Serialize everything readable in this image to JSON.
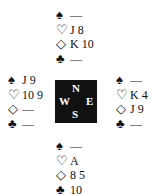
{
  "icons": {
    "spade": "♠",
    "heart": "♡",
    "diamond": "◇",
    "club": "♣"
  },
  "compass": {
    "n": "N",
    "s": "S",
    "w": "W",
    "e": "E"
  },
  "hands": {
    "north": {
      "spades": "—",
      "hearts": "J 8",
      "diamonds": "K 10",
      "clubs": "—"
    },
    "west": {
      "spades": "J 9",
      "hearts": "10 9",
      "diamonds": "—",
      "clubs": "—"
    },
    "east": {
      "spades": "—",
      "hearts": "K 4",
      "diamonds": "J 9",
      "clubs": "—"
    },
    "south": {
      "spades": "—",
      "hearts": "A",
      "diamonds": "8 5",
      "clubs": "10"
    }
  }
}
